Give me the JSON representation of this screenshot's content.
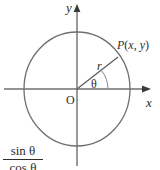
{
  "figure": {
    "kind": "unit-circle-trig-diagram",
    "stroke_color": "#6f6f6f",
    "text_color": "#2e2e2e",
    "background": "#ffffff"
  },
  "axes": {
    "y_label": "y",
    "x_label": "x",
    "origin_label": "O"
  },
  "circle": {
    "center_x": 77,
    "center_y": 89,
    "radius_x": 53,
    "radius_y": 57
  },
  "radius_line": {
    "label": "r",
    "end_x": 118,
    "end_y": 57
  },
  "angle": {
    "label": "θ",
    "arc_label": "theta-arc"
  },
  "point": {
    "label": "P(x, y)",
    "name": "P",
    "open_paren": "(",
    "coord_x": "x",
    "comma": ", ",
    "coord_y": "y",
    "close_paren": ")"
  },
  "formula": {
    "numerator": "sin θ",
    "denominator": "cos θ"
  }
}
